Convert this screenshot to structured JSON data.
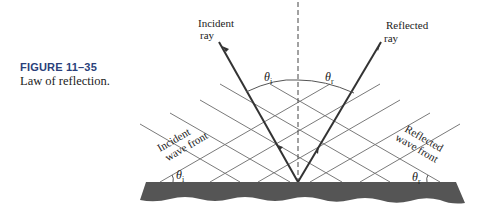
{
  "figure": {
    "number": "FIGURE 11–35",
    "title": "Law of reflection."
  },
  "labels": {
    "incident_ray": [
      "Incident",
      "ray"
    ],
    "reflected_ray": [
      "Reflected",
      "ray"
    ],
    "incident_wave_front": [
      "Incident",
      "wave front"
    ],
    "reflected_wave_front": [
      "Reflected",
      "wave front"
    ],
    "theta_i_top": {
      "symbol": "θ",
      "sub": "i"
    },
    "theta_r_top": {
      "symbol": "θ",
      "sub": "r"
    },
    "theta_i_bottom": {
      "symbol": "θ",
      "sub": "i"
    },
    "theta_r_bottom": {
      "symbol": "θ",
      "sub": "r"
    }
  },
  "colors": {
    "surface": "#555555",
    "ray": "#333333",
    "wave_front": "#777777",
    "caption_accent": "#2a3f7a"
  }
}
